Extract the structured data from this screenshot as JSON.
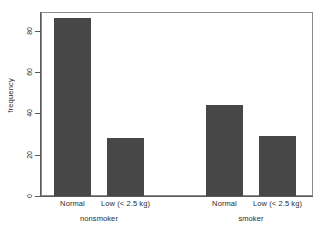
{
  "chart_data": {
    "type": "bar",
    "title": "",
    "xlabel": "",
    "ylabel": "frequency",
    "categories": [
      "Normal",
      "Low (< 2.5 kg)",
      "Normal",
      "Low (< 2.5 kg)"
    ],
    "values": [
      86,
      28,
      44,
      29
    ],
    "groups": [
      {
        "label": "nonsmoker",
        "categories": [
          "Normal",
          "Low (< 2.5 kg)"
        ],
        "values": [
          86,
          28
        ]
      },
      {
        "label": "smoker",
        "categories": [
          "Normal",
          "Low (< 2.5 kg)"
        ],
        "values": [
          44,
          29
        ]
      }
    ],
    "yticks": [
      0,
      20,
      40,
      60,
      80
    ],
    "ytick_labels": [
      "0",
      "20",
      "40",
      "60",
      "80"
    ],
    "ylim": [
      0,
      89
    ],
    "grid": false,
    "legend": "none",
    "bar_color": "#474747",
    "axis_color": "#5a5a5a",
    "frame_color": "#8a8a8a",
    "background_color": "#ffffff"
  }
}
